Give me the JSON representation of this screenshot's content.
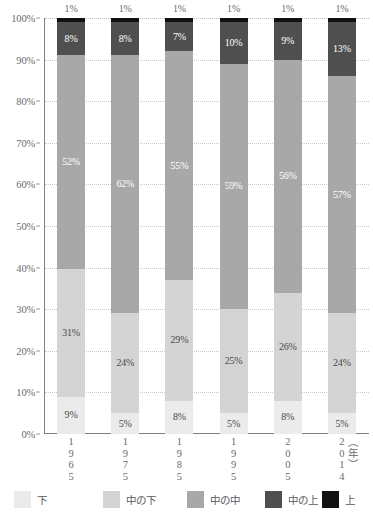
{
  "chart_data": {
    "type": "bar",
    "subtype": "stacked-100-percent",
    "title": "",
    "xlabel": "",
    "ylabel": "",
    "unit_label": "（年）",
    "ylim": [
      0,
      100
    ],
    "ytick_labels": [
      "0%",
      "10%",
      "20%",
      "30%",
      "40%",
      "50%",
      "60%",
      "70%",
      "80%",
      "90%",
      "100%"
    ],
    "ytick_values": [
      0,
      10,
      20,
      30,
      40,
      50,
      60,
      70,
      80,
      90,
      100
    ],
    "grid": true,
    "legend_position": "bottom",
    "categories": [
      "1965",
      "1975",
      "1985",
      "1995",
      "2005",
      "2014"
    ],
    "category_digits": [
      [
        "1",
        "9",
        "6",
        "5"
      ],
      [
        "1",
        "9",
        "7",
        "5"
      ],
      [
        "1",
        "9",
        "8",
        "5"
      ],
      [
        "1",
        "9",
        "9",
        "5"
      ],
      [
        "2",
        "0",
        "0",
        "5"
      ],
      [
        "2",
        "0",
        "1",
        "4"
      ]
    ],
    "series": [
      {
        "name": "下",
        "color": "#ebebeb",
        "label_color": "dark",
        "values": [
          9,
          5,
          8,
          5,
          8,
          5
        ],
        "value_labels": [
          "9%",
          "5%",
          "8%",
          "5%",
          "8%",
          "5%"
        ]
      },
      {
        "name": "中の下",
        "color": "#d4d4d4",
        "label_color": "dark",
        "values": [
          31,
          24,
          29,
          25,
          26,
          24
        ],
        "value_labels": [
          "31%",
          "24%",
          "29%",
          "25%",
          "26%",
          "24%"
        ]
      },
      {
        "name": "中の中",
        "color": "#a8a8a8",
        "label_color": "light",
        "values": [
          52,
          62,
          55,
          59,
          56,
          57
        ],
        "value_labels": [
          "52%",
          "62%",
          "55%",
          "59%",
          "56%",
          "57%"
        ]
      },
      {
        "name": "中の上",
        "color": "#4f4f4f",
        "label_color": "light",
        "values": [
          8,
          8,
          7,
          10,
          9,
          13
        ],
        "value_labels": [
          "8%",
          "8%",
          "7%",
          "10%",
          "9%",
          "13%"
        ]
      },
      {
        "name": "上",
        "color": "#111111",
        "label_color": "light",
        "values": [
          1,
          1,
          1,
          1,
          1,
          1
        ],
        "value_labels": [
          "1%",
          "1%",
          "1%",
          "1%",
          "1%",
          "1%"
        ],
        "labels_above_bar": true
      }
    ],
    "top_labels": [
      "1%",
      "1%",
      "1%",
      "1%",
      "1%",
      "1%"
    ]
  },
  "legend": {
    "items": [
      {
        "label": "下",
        "color": "#ebebeb"
      },
      {
        "label": "中の下",
        "color": "#d4d4d4"
      },
      {
        "label": "中の中",
        "color": "#a8a8a8"
      },
      {
        "label": "中の上",
        "color": "#4f4f4f"
      },
      {
        "label": "上",
        "color": "#111111"
      }
    ]
  },
  "colors": {
    "axis": "#808080",
    "gridline": "#c9c9c9",
    "text": "#5a5a5a",
    "background": "#ffffff"
  }
}
